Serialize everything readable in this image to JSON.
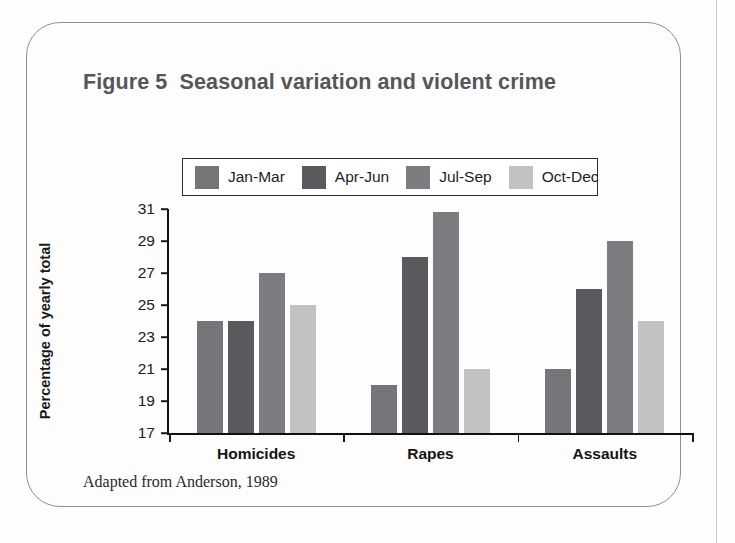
{
  "figure": {
    "title": "Figure 5  Seasonal variation and violent crime",
    "source": "Adapted from Anderson, 1989"
  },
  "chart_data": {
    "type": "bar",
    "title": "Figure 5  Seasonal variation and violent crime",
    "xlabel": "",
    "ylabel": "Percentage of yearly total",
    "ylim": [
      17,
      31
    ],
    "ytick_step": 2,
    "yticks": [
      31,
      29,
      27,
      25,
      23,
      21,
      19,
      17
    ],
    "grid": false,
    "legend_position": "top-center",
    "categories": [
      "Homicides",
      "Rapes",
      "Assaults"
    ],
    "series": [
      {
        "name": "Jan-Mar",
        "color": "#76767a",
        "values": [
          24,
          20,
          21
        ]
      },
      {
        "name": "Apr-Jun",
        "color": "#5a5a5e",
        "values": [
          24,
          28,
          26
        ]
      },
      {
        "name": "Jul-Sep",
        "color": "#7d7d81",
        "values": [
          27,
          30.8,
          29
        ]
      },
      {
        "name": "Oct-Dec",
        "color": "#c2c2c4",
        "values": [
          25,
          21,
          24
        ]
      }
    ],
    "annotation": "Adapted from Anderson, 1989"
  }
}
